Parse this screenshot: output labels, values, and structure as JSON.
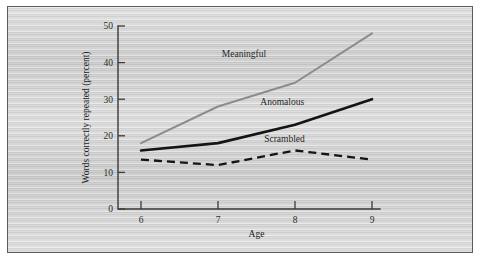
{
  "figure": {
    "background_color": "#d2d2d2",
    "frame_color": "#5c5c5c",
    "page_color": "#ffffff"
  },
  "chart_data": {
    "type": "line",
    "title": "",
    "subtitle": "",
    "xlabel": "Age",
    "ylabel": "Words correctly repeated (percent)",
    "x": [
      6,
      7,
      8,
      9
    ],
    "categories": [
      "6",
      "7",
      "8",
      "9"
    ],
    "xlim": [
      5.6,
      9.3
    ],
    "ylim": [
      0,
      50
    ],
    "xticks": [
      "6",
      "7",
      "8",
      "9"
    ],
    "yticks": [
      "0",
      "10",
      "20",
      "30",
      "40",
      "50"
    ],
    "ytick_values": [
      0,
      10,
      20,
      30,
      40,
      50
    ],
    "grid": false,
    "legend": "inline-labels",
    "legend_position": "inline",
    "series": [
      {
        "name": "Meaningful",
        "values": [
          18,
          28,
          34.5,
          48
        ],
        "color": "#8c8c8c",
        "style": "solid",
        "label_x": 7.05,
        "label_y": 41.5
      },
      {
        "name": "Anomalous",
        "values": [
          16,
          18,
          23,
          30
        ],
        "color": "#141414",
        "style": "solid",
        "label_x": 7.55,
        "label_y": 28.5
      },
      {
        "name": "Scrambled",
        "values": [
          13.5,
          12,
          16,
          13.5
        ],
        "color": "#141414",
        "style": "dashed",
        "label_x": 7.6,
        "label_y": 18.2
      }
    ]
  }
}
